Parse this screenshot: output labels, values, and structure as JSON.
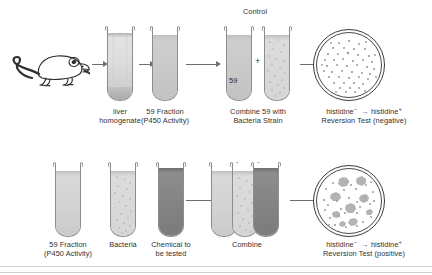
{
  "figure": {
    "title_semantic": "Ames test procedure diagram",
    "rows": [
      {
        "id": "control-row",
        "control_label": "Control",
        "steps": [
          {
            "id": "animal",
            "label_line1": "",
            "label_line2": ""
          },
          {
            "id": "liver-tube",
            "label_line1": "liver",
            "label_line2": "homogenate"
          },
          {
            "id": "s9-tube",
            "label_line1": "59 Fraction",
            "label_line2": "(P450 Activity)"
          },
          {
            "id": "combine-tubes",
            "label_line1": "Combine 59 with",
            "label_line2": "Bacteria Strain",
            "tube_number": "59",
            "plus": "+"
          },
          {
            "id": "plate",
            "label_line1": "histidine",
            "label_line2": "Reversion Test  (negative)",
            "histidine_from_sup": "−",
            "histidine_to": "histidine",
            "histidine_to_sup": "+",
            "result": "negative"
          }
        ]
      },
      {
        "id": "test-row",
        "control_label": "",
        "steps": [
          {
            "id": "s9-tube-2",
            "label_line1": "59 Fraction",
            "label_line2": "(P450 Activity)"
          },
          {
            "id": "bacteria-tube",
            "label_line1": "Bacteria",
            "label_line2": ""
          },
          {
            "id": "chemical-tube",
            "label_line1": "Chemical to",
            "label_line2": "be tested"
          },
          {
            "id": "combine-3",
            "label_line1": "Combine",
            "label_line2": ""
          },
          {
            "id": "plate-2",
            "label_line1": "histidine",
            "label_line2": "Reversion Test  (positive)",
            "histidine_from_sup": "−",
            "histidine_to": "histidine",
            "histidine_to_sup": "+",
            "result": "positive"
          }
        ]
      }
    ]
  },
  "colors": {
    "outline": "#8d8d8d",
    "dish_outline": "#3b3b3b",
    "arrow": "#6e6e6e",
    "text": "#313131",
    "fill_light": "#dcdcdc",
    "fill_medium": "#c9c9c9",
    "fill_dark": "#848484",
    "colony_small": "#9a9a9a",
    "colony_large": "#b0b0b0",
    "background": "#ffffff"
  }
}
